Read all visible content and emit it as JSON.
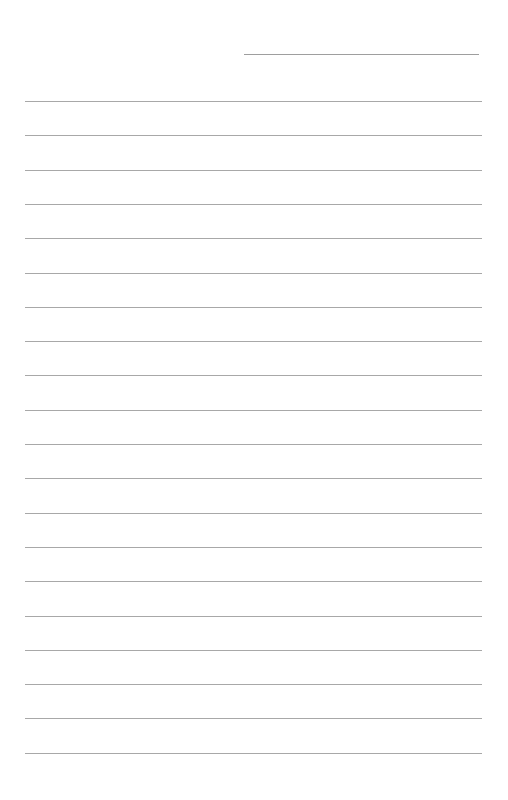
{
  "document": {
    "type": "lined-paper",
    "header_field": {
      "label": "",
      "value": ""
    },
    "line_count": 20,
    "lines": [
      "",
      "",
      "",
      "",
      "",
      "",
      "",
      "",
      "",
      "",
      "",
      "",
      "",
      "",
      "",
      "",
      "",
      "",
      "",
      ""
    ],
    "line_color": "#a8a8a8",
    "paper_color": "#ffffff"
  }
}
